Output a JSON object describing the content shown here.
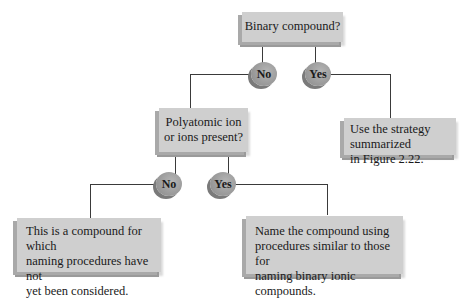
{
  "diagram": {
    "type": "decision-flowchart",
    "nodes": {
      "q1": {
        "label": "Binary compound?"
      },
      "q1_no": {
        "label": "No"
      },
      "q1_yes": {
        "label": "Yes"
      },
      "q2": {
        "label": "Polyatomic ion\nor ions present?"
      },
      "yes_result": {
        "label": "Use the strategy summarized\nin Figure 2.22."
      },
      "q2_no": {
        "label": "No"
      },
      "q2_yes": {
        "label": "Yes"
      },
      "no_result": {
        "label": "This is a compound for which\nnaming procedures have not\nyet been considered."
      },
      "ionic_result": {
        "label": "Name the compound using\nprocedures similar to those for\nnaming binary ionic compounds."
      }
    },
    "edges": [
      {
        "from": "q1",
        "to": "q1_no"
      },
      {
        "from": "q1",
        "to": "q1_yes"
      },
      {
        "from": "q1_no",
        "to": "q2"
      },
      {
        "from": "q1_yes",
        "to": "yes_result"
      },
      {
        "from": "q2",
        "to": "q2_no"
      },
      {
        "from": "q2",
        "to": "q2_yes"
      },
      {
        "from": "q2_no",
        "to": "no_result"
      },
      {
        "from": "q2_yes",
        "to": "ionic_result"
      }
    ],
    "colors": {
      "box": "#cfcfcf",
      "oval": "#9c9c9c",
      "line": "#3a3a3a"
    }
  }
}
